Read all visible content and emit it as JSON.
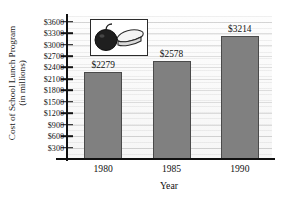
{
  "chart_data": {
    "type": "bar",
    "title": "",
    "categories": [
      "1980",
      "1985",
      "1990"
    ],
    "values": [
      2279,
      2578,
      3214
    ],
    "data_labels": [
      "$2279",
      "$2578",
      "$3214"
    ],
    "xlabel": "Year",
    "ylabel_line1": "Cost of School Lunch Program",
    "ylabel_line2": "(in millions)",
    "ylim": [
      0,
      3750
    ],
    "ytick_values": [
      300,
      600,
      900,
      1200,
      1500,
      1800,
      2100,
      2400,
      2700,
      3000,
      3300,
      3600
    ],
    "ytick_labels": [
      "$300",
      "$600",
      "$900",
      "$1200",
      "$1500",
      "$1800",
      "$2100",
      "$2400",
      "$2700",
      "$3000",
      "$3300",
      "$3600"
    ],
    "grid": "horizontal",
    "legend": "none",
    "bar_color": "#808080",
    "bar_edge_color": "#4a4a4a",
    "axis_color": "#111111",
    "plot_background": "#fbfbfb"
  },
  "inset": {
    "name": "apple-and-sandwich-illustration",
    "apple_color": "#1f1f1f",
    "sandwich_color": "#f2f2f2",
    "outline_color": "#2b2b2b"
  }
}
